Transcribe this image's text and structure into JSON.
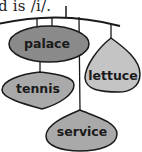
{
  "caption": "d is /i/.",
  "diagram": {
    "type": "mobile-hanger",
    "tags": [
      {
        "label": "palace",
        "shape": "ellipse",
        "fill": "#8a8a8a"
      },
      {
        "label": "lettuce",
        "shape": "teardrop",
        "fill": "#c4c4c4"
      },
      {
        "label": "tennis",
        "shape": "leaf",
        "fill": "#a9a9a9"
      },
      {
        "label": "service",
        "shape": "leaf",
        "fill": "#a9a9a9"
      }
    ],
    "colors": {
      "line": "#1a1a1a",
      "background": "#ffffff"
    }
  }
}
